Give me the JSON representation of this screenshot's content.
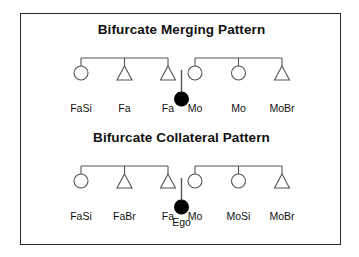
{
  "figure": {
    "background_color": "#ffffff",
    "border_color": "#2b2b2b",
    "line_color": "#555555",
    "text_color": "#111111",
    "ego_fill": "#000000"
  },
  "panels": [
    {
      "id": "bifurcate-merging",
      "title": "Bifurcate Merging Pattern",
      "parent_generation": [
        {
          "symbol": "circle",
          "label": "FaSi",
          "side": "father"
        },
        {
          "symbol": "triangle",
          "label": "Fa",
          "side": "father"
        },
        {
          "symbol": "triangle",
          "label": "Fa",
          "side": "father"
        },
        {
          "symbol": "circle",
          "label": "Mo",
          "side": "mother"
        },
        {
          "symbol": "circle",
          "label": "Mo",
          "side": "mother"
        },
        {
          "symbol": "triangle",
          "label": "MoBr",
          "side": "mother"
        }
      ],
      "marriage_symbol": "=",
      "ego": {
        "symbol": "filled-circle",
        "label": ""
      }
    },
    {
      "id": "bifurcate-collateral",
      "title": "Bifurcate Collateral Pattern",
      "parent_generation": [
        {
          "symbol": "circle",
          "label": "FaSi",
          "side": "father"
        },
        {
          "symbol": "triangle",
          "label": "FaBr",
          "side": "father"
        },
        {
          "symbol": "triangle",
          "label": "Fa",
          "side": "father"
        },
        {
          "symbol": "circle",
          "label": "Mo",
          "side": "mother"
        },
        {
          "symbol": "circle",
          "label": "MoSi",
          "side": "mother"
        },
        {
          "symbol": "triangle",
          "label": "MoBr",
          "side": "mother"
        }
      ],
      "marriage_symbol": "=",
      "ego": {
        "symbol": "filled-circle",
        "label": "Ego"
      }
    }
  ]
}
